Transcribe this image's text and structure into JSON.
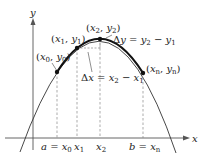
{
  "diagram": {
    "type": "arc-length-partition",
    "axes": {
      "x_label": "x",
      "y_label": "y"
    },
    "points": [
      {
        "id": "p0",
        "label_base_x": "x",
        "label_sub_x": "0",
        "label_base_y": "y",
        "label_sub_y": "0"
      },
      {
        "id": "p1",
        "label_base_x": "x",
        "label_sub_x": "1",
        "label_base_y": "y",
        "label_sub_y": "1"
      },
      {
        "id": "p2",
        "label_base_x": "x",
        "label_sub_x": "2",
        "label_base_y": "y",
        "label_sub_y": "2"
      },
      {
        "id": "pn",
        "label_base_x": "x",
        "label_sub_x": "n",
        "label_base_y": "y",
        "label_sub_y": "n"
      }
    ],
    "tick_labels": {
      "a_eq_x0": {
        "lhs": "a",
        "eq": " = ",
        "base": "x",
        "sub": "0"
      },
      "x1": {
        "base": "x",
        "sub": "1"
      },
      "x2": {
        "base": "x",
        "sub": "2"
      },
      "b_eq_xn": {
        "lhs": "b",
        "eq": " = ",
        "base": "x",
        "sub": "n"
      }
    },
    "annotations": {
      "delta_y": {
        "delta": "Δ",
        "var": "y",
        "eq": " = ",
        "a": "y",
        "a_sub": "2",
        "minus": " − ",
        "b": "y",
        "b_sub": "1"
      },
      "delta_x": {
        "delta": "Δ",
        "var": "x",
        "eq": " = ",
        "a": "x",
        "a_sub": "2",
        "minus": " − ",
        "b": "x",
        "b_sub": "1"
      }
    },
    "colors": {
      "curve": "#333333",
      "thick_curve": "#111111",
      "axis": "#555555",
      "dashed": "#888888",
      "text": "#222222"
    }
  }
}
